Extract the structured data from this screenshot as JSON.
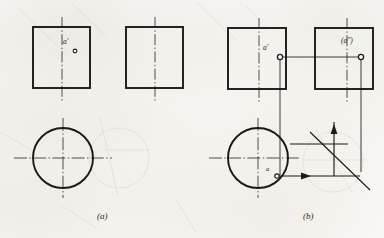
{
  "figure": {
    "ink_color": "#1a1a18",
    "ghost_color": "#c9c3ba",
    "paper_color": "#fbfaf8",
    "width": 384,
    "height": 238
  },
  "captions": [
    {
      "id": "caption-a",
      "text": "(a)",
      "x": 97,
      "y": 214
    },
    {
      "id": "caption-b",
      "text": "(b)",
      "x": 303,
      "y": 214
    }
  ],
  "panels": [
    {
      "id": "panel-a",
      "caption": "(a)",
      "front_view": {
        "name": "front-view-square",
        "x": 33,
        "y": 27,
        "w": 57,
        "h": 61,
        "centerline_x": 62,
        "centerline_top": 17,
        "centerline_bottom": 101
      },
      "side_view": {
        "name": "side-view-square",
        "x": 126,
        "y": 27,
        "w": 57,
        "h": 61,
        "centerline_x": 155,
        "centerline_top": 17,
        "centerline_bottom": 101
      },
      "top_view": {
        "name": "top-view-circle",
        "cx": 63,
        "cy": 158,
        "r": 30,
        "h_centerline_x1": 14,
        "h_centerline_x2": 112,
        "v_centerline_y1": 118,
        "v_centerline_y2": 198
      },
      "labels": [
        {
          "id": "label-a-prime",
          "text": "a′",
          "x": 66,
          "y": 44,
          "size": 7
        },
        {
          "id": "label-a-prime-dot",
          "text": "○",
          "x": 74,
          "y": 49,
          "size": 4
        }
      ]
    },
    {
      "id": "panel-b",
      "caption": "(b)",
      "front_view": {
        "name": "front-view-square",
        "x": 228,
        "y": 28,
        "w": 58,
        "h": 61,
        "centerline_x": 259,
        "centerline_top": 18,
        "centerline_bottom": 102
      },
      "side_view": {
        "name": "side-view-square",
        "x": 315,
        "y": 28,
        "w": 58,
        "h": 61,
        "centerline_x": 347,
        "centerline_top": 18,
        "centerline_bottom": 102
      },
      "top_view": {
        "name": "top-view-circle",
        "cx": 258,
        "cy": 158,
        "r": 30,
        "h_centerline_x1": 209,
        "h_centerline_x2": 300,
        "v_centerline_y1": 118,
        "v_centerline_y2": 198
      },
      "points": [
        {
          "id": "point-a-prime",
          "label": "a′",
          "cx": 280,
          "cy": 57,
          "r": 2.6
        },
        {
          "id": "point-a-dprime",
          "label": "(a″)",
          "cx": 361,
          "cy": 57,
          "r": 2.6
        },
        {
          "id": "point-a",
          "label": "a",
          "cx": 277,
          "cy": 176,
          "r": 2.2
        }
      ],
      "labels": [
        {
          "id": "label-a-prime",
          "text": "a′",
          "x": 266,
          "y": 50,
          "size": 7
        },
        {
          "id": "label-a-dprime",
          "text": "(a″)",
          "x": 344,
          "y": 42,
          "size": 7
        },
        {
          "id": "label-a",
          "text": "a",
          "x": 268,
          "y": 170,
          "size": 6
        }
      ],
      "projection_lines": [
        {
          "id": "proj-vertical-front",
          "x1": 280,
          "y1": 57,
          "x2": 280,
          "y2": 178
        },
        {
          "id": "proj-horizontal-side",
          "x1": 280,
          "y1": 57,
          "x2": 361,
          "y2": 57
        },
        {
          "id": "proj-vertical-side",
          "x1": 361,
          "y1": 57,
          "x2": 361,
          "y2": 178
        }
      ],
      "axis_system": {
        "id": "axis-system",
        "origin_x": 334,
        "origin_y": 144,
        "vertical_arrow": {
          "x1": 334,
          "y1": 176,
          "x2": 334,
          "y2": 122
        },
        "horizontal_arrow": {
          "x1": 281,
          "y1": 176,
          "x2": 361,
          "y2": 176
        },
        "diagonal_line": {
          "x1": 310,
          "y1": 132,
          "x2": 370,
          "y2": 190
        }
      }
    }
  ],
  "ghost_marks": {
    "description": "faint bleed-through from reverse side of page",
    "circle_a": {
      "cx": 119,
      "cy": 158,
      "r": 30
    },
    "circle_b": {
      "cx": 333,
      "cy": 162,
      "r": 30
    },
    "strokes": [
      {
        "x1": 18,
        "y1": 8,
        "x2": 66,
        "y2": 54
      },
      {
        "x1": 72,
        "y1": 4,
        "x2": 106,
        "y2": 36
      },
      {
        "x1": 196,
        "y1": 2,
        "x2": 236,
        "y2": 40
      },
      {
        "x1": 0,
        "y1": 132,
        "x2": 32,
        "y2": 150
      },
      {
        "x1": 100,
        "y1": 118,
        "x2": 118,
        "y2": 196
      },
      {
        "x1": 316,
        "y1": 130,
        "x2": 352,
        "y2": 192
      }
    ]
  }
}
